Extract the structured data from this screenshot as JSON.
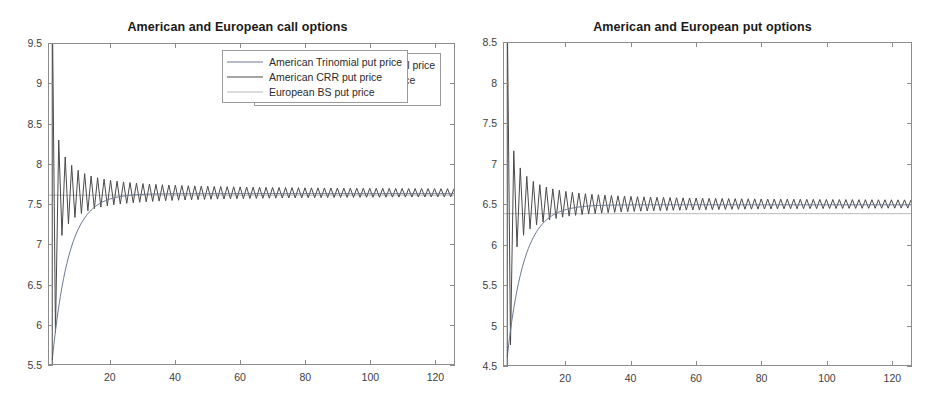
{
  "figure": {
    "background": "#ffffff",
    "width": 934,
    "height": 417
  },
  "panels": [
    {
      "id": "call",
      "title": "American and European call options"
    },
    {
      "id": "put",
      "title": "American and European put options"
    }
  ],
  "legend_call": {
    "items": [
      {
        "label": "American Trinomial call price",
        "color": "#6b7a93"
      },
      {
        "label": "American CRR call price",
        "color": "#4a4a4a"
      },
      {
        "label": "European BS call price",
        "color": "#b9b9b9"
      }
    ]
  },
  "legend_put": {
    "items": [
      {
        "label": "American Trinomial put price",
        "color": "#6b7a93"
      },
      {
        "label": "American CRR put price",
        "color": "#4a4a4a"
      },
      {
        "label": "European BS put price",
        "color": "#b9b9b9"
      }
    ]
  },
  "ticks_call": {
    "y": [
      "9.5",
      "9",
      "8.5",
      "8",
      "7.5",
      "7",
      "6.5",
      "6",
      "5.5"
    ],
    "x": [
      "20",
      "40",
      "60",
      "80",
      "100",
      "120"
    ]
  },
  "ticks_put": {
    "y": [
      "8.5",
      "8",
      "7.5",
      "7",
      "6.5",
      "6",
      "5.5",
      "5",
      "4.5"
    ],
    "x": [
      "20",
      "40",
      "60",
      "80",
      "100",
      "120"
    ]
  },
  "chart_data": [
    {
      "type": "line",
      "id": "call",
      "title": "American and European call options",
      "xlabel": "",
      "ylabel": "",
      "xlim": [
        1,
        126
      ],
      "ylim": [
        5.5,
        9.5
      ],
      "grid": false,
      "legend_position": "top-right",
      "xticks": [
        20,
        40,
        60,
        80,
        100,
        120
      ],
      "yticks": [
        5.5,
        6,
        6.5,
        7,
        7.5,
        8,
        8.5,
        9,
        9.5
      ],
      "notes": "Binomial/trinomial convergence study: number of time steps N on x-axis, option price on y-axis. CRR price oscillates with odd/even N and damps toward the limit; trinomial converges smoothly from below; Black-Scholes European price is constant.",
      "converged_value": 7.64,
      "series": [
        {
          "name": "American Trinomial call price",
          "color": "#6b7a93",
          "style": "smooth-converging-from-below",
          "start_value": 5.55,
          "limit_value": 7.63,
          "amplitude_at_n2": 2.05,
          "decay": "monotone"
        },
        {
          "name": "American CRR call price",
          "color": "#4a4a4a",
          "style": "oscillating-damped",
          "limit_value": 7.64,
          "peak_values": [
            9.5,
            8.25,
            8.05,
            7.98,
            7.92,
            7.88,
            7.85,
            7.83,
            7.81,
            7.8
          ],
          "trough_values": [
            5.95,
            7.3,
            7.42,
            7.48,
            7.52,
            7.55,
            7.57,
            7.58,
            7.59,
            7.6
          ],
          "amplitude_decay": "~1/N",
          "residual_amplitude_at_n120": 0.035
        },
        {
          "name": "European BS call price",
          "color": "#b9b9b9",
          "style": "constant",
          "value": 7.61
        }
      ]
    },
    {
      "type": "line",
      "id": "put",
      "title": "American and European put options",
      "xlabel": "",
      "ylabel": "",
      "xlim": [
        1,
        126
      ],
      "ylim": [
        4.5,
        8.5
      ],
      "grid": false,
      "legend_position": "top-right",
      "xticks": [
        20,
        40,
        60,
        80,
        100,
        120
      ],
      "yticks": [
        4.5,
        5,
        5.5,
        6,
        6.5,
        7,
        7.5,
        8,
        8.5
      ],
      "notes": "Same convergence study for the put. CRR oscillates and damps toward about 6.5; trinomial rises smoothly from about 4.6; the European Black-Scholes put price is a constant line slightly below the American limit.",
      "converged_value": 6.5,
      "series": [
        {
          "name": "American Trinomial put price",
          "color": "#6b7a93",
          "style": "smooth-converging-from-below",
          "start_value": 4.6,
          "limit_value": 6.49,
          "decay": "monotone"
        },
        {
          "name": "American CRR put price",
          "color": "#4a4a4a",
          "style": "oscillating-damped",
          "limit_value": 6.5,
          "peak_values": [
            8.5,
            7.1,
            6.92,
            6.84,
            6.78,
            6.74,
            6.71,
            6.69,
            6.67,
            6.66
          ],
          "trough_values": [
            4.85,
            6.15,
            6.28,
            6.34,
            6.38,
            6.41,
            6.43,
            6.44,
            6.45,
            6.46
          ],
          "amplitude_decay": "~1/N",
          "residual_amplitude_at_n120": 0.035
        },
        {
          "name": "European BS put price",
          "color": "#b9b9b9",
          "style": "constant",
          "value": 6.38
        }
      ]
    }
  ]
}
